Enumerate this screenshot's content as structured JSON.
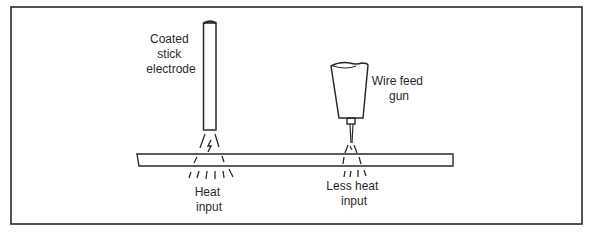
{
  "figure": {
    "left_tool": {
      "label_lines": [
        "Coated",
        "stick",
        "electrode"
      ],
      "heat_label_lines": [
        "Heat",
        "input"
      ]
    },
    "right_tool": {
      "label_lines": [
        "Wire feed",
        "gun"
      ],
      "heat_label_lines": [
        "Less heat",
        "input"
      ]
    },
    "colors": {
      "line": "#2a2a2a",
      "background": "#ffffff"
    }
  }
}
